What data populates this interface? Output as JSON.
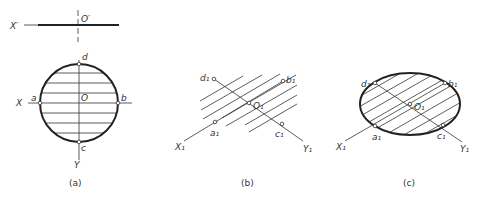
{
  "panels": [
    {
      "caption": "(a)",
      "labels": {
        "x_prime": "X′",
        "o_prime": "O′",
        "x": "X",
        "y": "Y",
        "o": "O",
        "a": "a",
        "b": "b",
        "c": "c",
        "d": "d"
      }
    },
    {
      "caption": "(b)",
      "labels": {
        "x1": "X₁",
        "y1": "Y₁",
        "o1": "O₁",
        "a1": "a₁",
        "b1": "b₁",
        "c1": "c₁",
        "d1": "d₁"
      }
    },
    {
      "caption": "(c)",
      "labels": {
        "x1": "X₁",
        "y1": "Y₁",
        "o1": "O₁",
        "a1": "a₁",
        "b1": "b₁",
        "c1": "c₁",
        "d1": "d₁"
      }
    }
  ],
  "colors": {
    "line": "#222222",
    "background": "#ffffff"
  }
}
